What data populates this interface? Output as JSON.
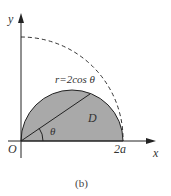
{
  "figure": {
    "caption": "(b)",
    "axes": {
      "x_label": "x",
      "y_label": "y",
      "origin_label": "O",
      "x_tick_label": "2a"
    },
    "curve_label": "r=2cos θ",
    "region_label": "D",
    "angle_label": "θ",
    "colors": {
      "region_fill": "#a9a9a9",
      "stroke": "#222222"
    }
  }
}
